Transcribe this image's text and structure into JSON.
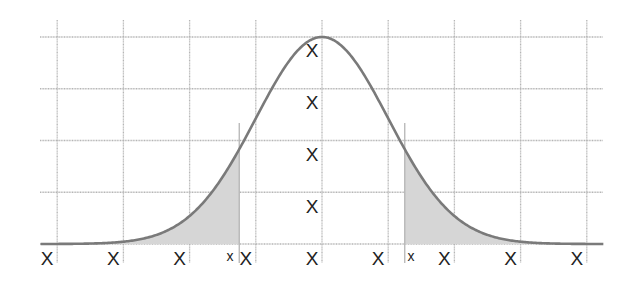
{
  "chart_data": {
    "type": "area",
    "title": "",
    "xlabel": "",
    "ylabel": "",
    "grid": true,
    "legend": null,
    "x_ticks": [
      -4,
      -3,
      -2,
      -1,
      0,
      1,
      2,
      3,
      4
    ],
    "x_tick_labels": [
      "X",
      "X",
      "X",
      "X",
      "X",
      "X",
      "X",
      "X",
      "X"
    ],
    "y_tick_labels": [
      "X",
      "X",
      "X",
      "X"
    ],
    "critical_value_labels": [
      "x",
      "x"
    ],
    "xlim": [
      -4.25,
      4.25
    ],
    "ylim": [
      0,
      0.4
    ],
    "curve": {
      "name": "normal density",
      "mean": 0,
      "sd": 1,
      "peak": 0.399
    },
    "shaded_regions": [
      {
        "from": -4.25,
        "to": -1.25,
        "label": "left tail"
      },
      {
        "from": 1.25,
        "to": 4.25,
        "label": "right tail"
      }
    ],
    "critical_values": [
      -1.25,
      1.25
    ]
  },
  "colors": {
    "grid": "#b5b5b5",
    "curve": "#7a7a7a",
    "shade": "#d6d6d6",
    "text": "#222222"
  }
}
